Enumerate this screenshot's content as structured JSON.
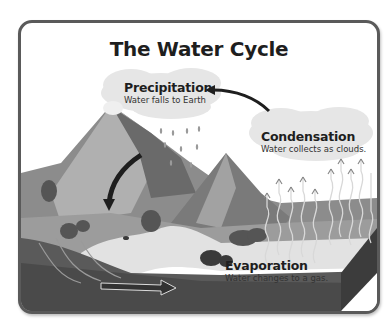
{
  "title": "The Water Cycle",
  "stages": [
    {
      "name": "Precipitation",
      "description": "Water falls to Earth"
    },
    {
      "name": "Condensation",
      "description": "Water collects as clouds."
    },
    {
      "name": "Evaporation",
      "description": "Water changes to a gas."
    }
  ],
  "colors": {
    "frame_border": "#5a5a5a",
    "sky": "#ffffff",
    "cloud": "#e4e4e4",
    "mountain_light": "#a8a8a8",
    "mountain_dark": "#6e6e6e",
    "ground": "#9a9a9a",
    "water_ground": "#4a4a4a",
    "river": "#e8e8e8",
    "text": "#1e1e1e"
  }
}
